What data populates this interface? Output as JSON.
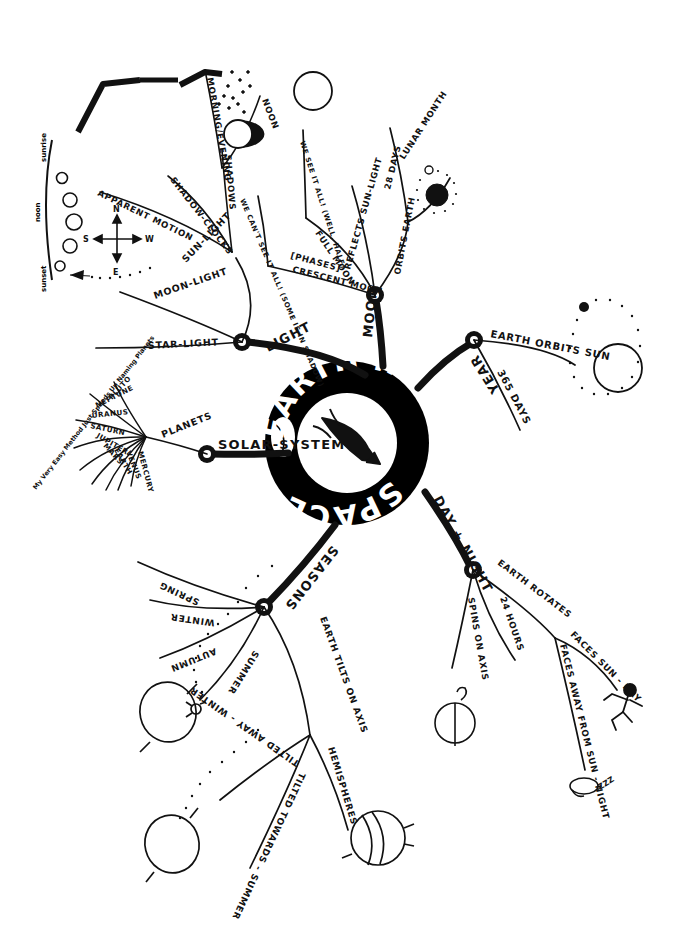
{
  "title": "EARTH IN SPACE",
  "center": {
    "ring_text": "EARTH IN SPACE",
    "ring_text_top": "EARTH IN",
    "ring_text_bottom": "SPACE",
    "center_icon": "rocket-icon",
    "ring_color": "#000000",
    "ring_text_color": "#ffffff"
  },
  "ink_color": "#111111",
  "paper_color": "#ffffff",
  "branches": [
    {
      "id": "light",
      "label": "LIGHT",
      "children": [
        {
          "label": "MOON-LIGHT"
        },
        {
          "label": "STAR-LIGHT"
        },
        {
          "label": "SUN-LIGHT",
          "children": [
            {
              "label": "APPARENT MOTION"
            },
            {
              "label": "SHADOW-CLOCKS"
            },
            {
              "label": "SHADOWS",
              "children": [
                {
                  "label": "MORNING/EVENING"
                },
                {
                  "label": "NOON"
                }
              ]
            }
          ]
        }
      ]
    },
    {
      "id": "moon",
      "label": "MOON",
      "children": [
        {
          "label": "[PHASES]",
          "children": [
            {
              "label": "CRESCENT MOON",
              "note": "WE CAN'T SEE IT ALL! (SOME IS IN SHADOW)"
            },
            {
              "label": "FULL MOON",
              "note": "WE SEE IT ALL! (WELL, HALF)"
            }
          ]
        },
        {
          "label": "REFLECTS SUN-LIGHT"
        },
        {
          "label": "ORBITS EARTH",
          "children": [
            {
              "label": "28 DAYS"
            },
            {
              "label": "LUNAR MONTH"
            }
          ]
        }
      ]
    },
    {
      "id": "year",
      "label": "YEAR",
      "children": [
        {
          "label": "EARTH ORBITS SUN"
        },
        {
          "label": "365 DAYS"
        }
      ]
    },
    {
      "id": "daynight",
      "label": "DAY + NIGHT",
      "children": [
        {
          "label": "SPINS ON AXIS"
        },
        {
          "label": "24 HOURS"
        },
        {
          "label": "EARTH ROTATES",
          "children": [
            {
              "label": "FACES SUN - DAY"
            },
            {
              "label": "FACES AWAY FROM SUN - NIGHT"
            }
          ]
        }
      ]
    },
    {
      "id": "seasons",
      "label": "SEASONS",
      "children": [
        {
          "label": "SPRING"
        },
        {
          "label": "WINTER"
        },
        {
          "label": "AUTUMN"
        },
        {
          "label": "SUMMER"
        },
        {
          "label": "EARTH TILTS ON AXIS",
          "children": [
            {
              "label": "TILTED AWAY - WINTER"
            },
            {
              "label": "TILTED TOWARDS - SUMMER"
            },
            {
              "label": "HEMISPHERES"
            }
          ]
        }
      ]
    },
    {
      "id": "solar",
      "label": "SOLAR-SYSTEM",
      "children": [
        {
          "label": "PLANETS",
          "children": [
            {
              "label": "MERCURY"
            },
            {
              "label": "VENUS"
            },
            {
              "label": "EARTH"
            },
            {
              "label": "MARS"
            },
            {
              "label": "JUPITER"
            },
            {
              "label": "SATURN"
            },
            {
              "label": "URANUS"
            },
            {
              "label": "NEPTUNE"
            },
            {
              "label": "PLUTO"
            }
          ],
          "mnemonic": "My Very Easy Method Just Speeds Up Naming Planets"
        }
      ]
    }
  ],
  "compass": {
    "n": "N",
    "s": "S",
    "e": "E",
    "w": "W"
  },
  "sun_arc_diagram": {
    "sunrise": "sunrise",
    "noon": "noon",
    "sunset": "sunset"
  },
  "sleep_sound": "ZZZ",
  "sketches": [
    {
      "name": "long-shadow-sketch"
    },
    {
      "name": "short-shadow-sketch"
    },
    {
      "name": "gibbous-moon-sketch"
    },
    {
      "name": "full-moon-circle-sketch"
    },
    {
      "name": "moon-orbit-earth-sketch"
    },
    {
      "name": "earth-orbit-sun-sketch"
    },
    {
      "name": "tilted-earth-summer-sketch"
    },
    {
      "name": "tilted-earth-winter-sketch"
    },
    {
      "name": "hemispheres-globe-sketch"
    },
    {
      "name": "rotating-earth-sketch"
    },
    {
      "name": "dancing-stick-figure"
    },
    {
      "name": "sleeping-stick-figure"
    }
  ]
}
